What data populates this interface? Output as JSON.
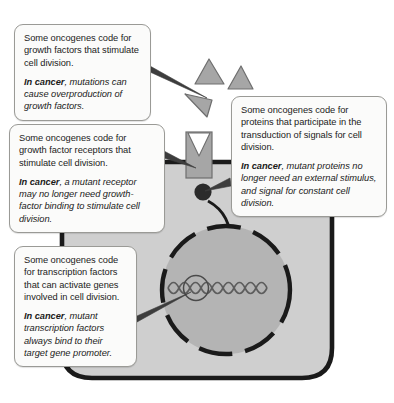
{
  "diagram": {
    "colors": {
      "cytoplasm": "#cfcfcf",
      "nucleus": "#b4b4b4",
      "membrane": "#1a1a1a",
      "molecule": "#a6a6a6",
      "molecule_outline": "#6e6e6e",
      "callout_background": "#fbfbfa",
      "callout_border": "#9a9a96",
      "text": "#1b1b1b",
      "dna": "#5d5d5d",
      "page_background": "#ffffff"
    }
  },
  "callouts": [
    {
      "id": "growth-factors",
      "plain": "Some oncogenes code for growth factors that stimulate cell division.",
      "cancer_lead": "In cancer",
      "cancer_rest": ", mutations can cause overproduction of growth factors."
    },
    {
      "id": "receptors",
      "plain": "Some oncogenes code for growth factor receptors that stimulate cell division.",
      "cancer_lead": "In cancer",
      "cancer_rest": ", a mutant receptor may no longer need growth-factor binding to stimulate cell division."
    },
    {
      "id": "transduction",
      "plain": "Some oncogenes code for proteins that participate in the transduction of signals for cell division.",
      "cancer_lead": "In cancer",
      "cancer_rest": ", mutant proteins no longer need an external stimulus, and signal for constant cell division."
    },
    {
      "id": "transcription",
      "plain": "Some oncogenes code for transcription factors that can activate genes involved in cell division.",
      "cancer_lead": "In cancer",
      "cancer_rest": ", mutant transcription factors always bind to their target gene promoter."
    }
  ],
  "cell_parts": {
    "growth_factor_1": "growth-factor-triangle",
    "growth_factor_2": "growth-factor-triangle",
    "growth_factor_3": "growth-factor-triangle",
    "receptor": "growth-factor-receptor",
    "membrane": "plasma-membrane",
    "signal_protein": "signal-transduction-protein",
    "signal_arrow": "signal-transduction-arrow",
    "nucleus": "nucleus",
    "dna": "dna-double-helix",
    "promoter": "target-gene-promoter"
  }
}
